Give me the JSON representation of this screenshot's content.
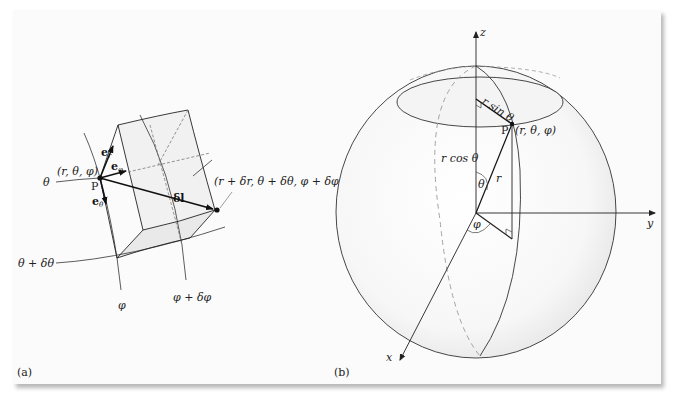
{
  "figure": {
    "panel_a": {
      "caption": "(a)",
      "point_label": "P",
      "point_coords": "(r, θ, φ)",
      "endpoint_coords": "(r + δr, θ + δθ, φ + δφ)",
      "displacement_label": "δl",
      "unit_vectors": {
        "er": "e",
        "er_sub": "r",
        "ephi": "e",
        "ephi_sub": "φ",
        "etheta": "e",
        "etheta_sub": "θ"
      },
      "curve_labels": {
        "theta": "θ",
        "theta_plus": "θ + δθ",
        "phi": "φ",
        "phi_plus": "φ + δφ"
      }
    },
    "panel_b": {
      "caption": "(b)",
      "axes": {
        "x": "x",
        "y": "y",
        "z": "z"
      },
      "point_label": "P",
      "point_coords": "(r, θ, φ)",
      "labels": {
        "r_sin_theta": "r sin θ",
        "r_cos_theta": "r cos θ",
        "r": "r",
        "theta": "θ",
        "phi": "φ"
      }
    },
    "colors": {
      "line": "#333333",
      "shade": "#ececec",
      "panel": "#fbfbfb",
      "dashed": "#888888"
    }
  }
}
